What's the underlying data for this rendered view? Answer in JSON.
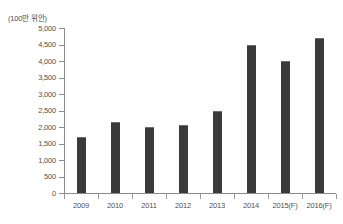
{
  "chart_data": {
    "type": "bar",
    "title": "",
    "subtitle": "",
    "unit_label": "(100만 위안)",
    "xlabel": "",
    "ylabel": "",
    "categories": [
      "2009",
      "2010",
      "2011",
      "2012",
      "2013",
      "2014",
      "2015(F)",
      "2016(F)"
    ],
    "values": [
      1700,
      2150,
      2000,
      2050,
      2500,
      4500,
      4000,
      4700
    ],
    "series": [
      {
        "name": "",
        "values": [
          1700,
          2150,
          2000,
          2050,
          2500,
          4500,
          4000,
          4700
        ]
      }
    ],
    "ylim": [
      0,
      5000
    ],
    "ytick_values": [
      0,
      500,
      1000,
      1500,
      2000,
      2500,
      3000,
      3500,
      4000,
      4500,
      5000
    ],
    "ytick_labels": [
      "0",
      "500",
      "1,000",
      "1,500",
      "2,000",
      "2,500",
      "3,000",
      "3,500",
      "4,000",
      "4,500",
      "5,000"
    ],
    "grid": false,
    "legend": null,
    "legend_position": "none",
    "bar_color": "#3a3a3a",
    "axis_color": "#8c8c8c",
    "text_color": "#4f4f4f",
    "background_color": "#ffffff",
    "annotations": []
  }
}
